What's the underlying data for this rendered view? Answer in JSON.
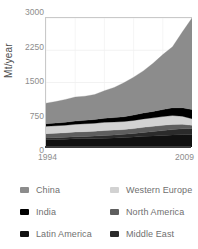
{
  "chart_data": {
    "type": "area",
    "title": "",
    "subtitle": "",
    "xlabel": "",
    "ylabel": "Mt/year",
    "stacked": true,
    "grid": true,
    "legend_position": "bottom",
    "xlim": [
      1994,
      2009
    ],
    "ylim": [
      0,
      3000
    ],
    "ytick_labels": [
      "3000",
      "2250",
      "1500",
      "750",
      "0"
    ],
    "ytick_values": [
      3000,
      2250,
      1500,
      750,
      0
    ],
    "xtick_labels": [
      "1994",
      "2009"
    ],
    "xtick_values": [
      1994,
      2009
    ],
    "x": [
      1994,
      1995,
      1996,
      1997,
      1998,
      1999,
      2000,
      2001,
      2002,
      2003,
      2004,
      2005,
      2006,
      2007,
      2008,
      2009
    ],
    "series": [
      {
        "name": "Latin America",
        "color": "#111111",
        "values": [
          170,
          175,
          182,
          190,
          193,
          196,
          205,
          212,
          220,
          232,
          248,
          258,
          268,
          280,
          286,
          282
        ]
      },
      {
        "name": "Middle East",
        "color": "#2b2b2b",
        "values": [
          40,
          43,
          46,
          50,
          54,
          58,
          63,
          68,
          74,
          82,
          92,
          102,
          114,
          126,
          138,
          146
        ]
      },
      {
        "name": "North America",
        "color": "#5e5e5e",
        "values": [
          100,
          102,
          104,
          108,
          110,
          112,
          116,
          114,
          112,
          114,
          118,
          120,
          122,
          120,
          104,
          78
        ]
      },
      {
        "name": "Western Europe",
        "color": "#d2d2d2",
        "values": [
          172,
          174,
          176,
          180,
          184,
          186,
          190,
          188,
          186,
          190,
          196,
          198,
          204,
          206,
          188,
          152
        ]
      },
      {
        "name": "India",
        "color": "#000000",
        "values": [
          58,
          62,
          68,
          74,
          80,
          88,
          95,
          102,
          112,
          124,
          136,
          148,
          162,
          178,
          196,
          212
        ]
      },
      {
        "name": "China",
        "color": "#8c8c8c",
        "values": [
          480,
          500,
          530,
          560,
          560,
          580,
          640,
          700,
          790,
          880,
          980,
          1120,
          1280,
          1420,
          1760,
          2130
        ]
      }
    ]
  },
  "axis": {
    "ylabel": "Mt/year",
    "yticks": [
      "3000",
      "2250",
      "1500",
      "750",
      "0"
    ],
    "xtick_start": "1994",
    "xtick_end": "2009"
  },
  "legend": {
    "rows": [
      {
        "left": {
          "label": "China",
          "color": "#8c8c8c"
        },
        "right": {
          "label": "Western Europe",
          "color": "#d2d2d2"
        }
      },
      {
        "left": {
          "label": "India",
          "color": "#000000"
        },
        "right": {
          "label": "North America",
          "color": "#5e5e5e"
        }
      },
      {
        "left": {
          "label": "Latin America",
          "color": "#111111"
        },
        "right": {
          "label": "Middle East",
          "color": "#2b2b2b"
        }
      }
    ]
  }
}
